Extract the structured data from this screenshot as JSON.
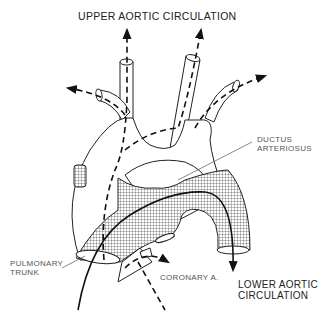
{
  "diagram": {
    "type": "anatomical flow diagram (fetal heart circulation)",
    "labels": {
      "upper_circulation": "UPPER AORTIC CIRCULATION",
      "ductus_line1": "DUCTUS",
      "ductus_line2": "ARTERIOSUS",
      "pulmonary_line1": "PULMONARY",
      "pulmonary_line2": "TRUNK",
      "coronary": "CORONARY A.",
      "lower_line1": "LOWER AORTIC",
      "lower_line2": "CIRCULATION"
    },
    "structures": [
      {
        "name": "aortic arch",
        "fill": "white outline"
      },
      {
        "name": "brachiocephalic branches",
        "count": 3
      },
      {
        "name": "pulmonary trunk / ductus",
        "fill": "cross-hatched"
      },
      {
        "name": "coronary artery",
        "fill": "white outline"
      }
    ],
    "flows": [
      {
        "style": "dashed",
        "path": "ascending aorta to upper aortic circulation (3 arrows)"
      },
      {
        "style": "dashed",
        "path": "to coronary artery"
      },
      {
        "style": "solid",
        "path": "pulmonary trunk through ductus arteriosus to lower aortic circulation"
      }
    ],
    "colors": {
      "line": "#222222",
      "background": "#ffffff",
      "hatch": "#333333"
    }
  }
}
